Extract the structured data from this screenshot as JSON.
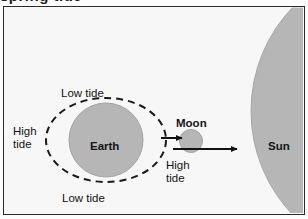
{
  "figure": {
    "type": "diagram",
    "clipped_caption_above": "spring tide",
    "frame": {
      "border_color": "#2a2a2a",
      "fill_color": "#f7f7f7"
    },
    "body_fill_color": "#b4b4b4",
    "body_stroke_color": "#9a9a9a",
    "dash_color": "#1a1a1a",
    "arrow_color": "#111111",
    "bodies": [
      {
        "name": "Earth",
        "label": "Earth",
        "shape": "circle",
        "cx": 105,
        "cy": 139,
        "r": 37
      },
      {
        "name": "Moon",
        "label": "Moon",
        "shape": "circle",
        "cx": 190,
        "cy": 140,
        "r": 11
      },
      {
        "name": "Sun",
        "label": "Sun",
        "shape": "circle-arc-right-edge",
        "cx": 400,
        "cy": 110,
        "r": 150
      }
    ],
    "tidal_bulge": {
      "shape": "dashed-ellipse",
      "cx": 105,
      "cy": 139,
      "rx": 60,
      "ry": 42,
      "dash_pattern": "7 5",
      "stroke_width": 2
    },
    "labels": {
      "low_tide_top": "Low tide",
      "low_tide_bottom": "Low tide",
      "high_tide_left": "High\ntide",
      "high_tide_moon": "High\ntide",
      "earth": "Earth",
      "moon": "Moon",
      "sun": "Sun"
    },
    "arrows": [
      {
        "name": "moon-pull-arrow",
        "x1": 160,
        "y1": 137,
        "x2": 181,
        "y2": 137
      },
      {
        "name": "sun-pull-arrow",
        "x1": 172,
        "y1": 148,
        "x2": 236,
        "y2": 148
      }
    ]
  }
}
